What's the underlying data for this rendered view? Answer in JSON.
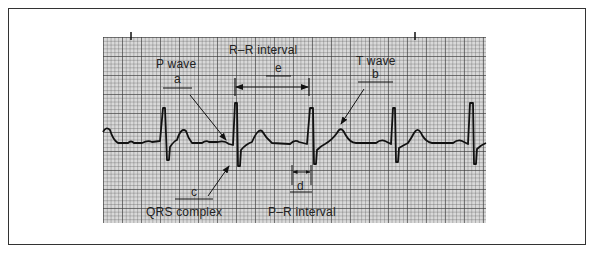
{
  "figure": {
    "grid_color": "#d9d9d9",
    "trace_color": "#111111",
    "labels": {
      "p_wave": {
        "text": "P wave",
        "letter": "a"
      },
      "t_wave": {
        "text": "T wave",
        "letter": "b"
      },
      "qrs_complex": {
        "text": "QRS complex",
        "letter": "c"
      },
      "pr_interval": {
        "text": "P–R interval",
        "letter": "d"
      },
      "rr_interval": {
        "text": "R–R interval",
        "letter": "e"
      }
    },
    "beats_visible": 5,
    "r_peaks_x": [
      164,
      235,
      312,
      395,
      472
    ]
  }
}
